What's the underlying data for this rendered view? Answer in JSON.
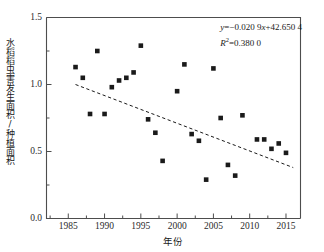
{
  "chart_data": {
    "type": "scatter",
    "title": "",
    "xlabel": "年份",
    "ylabel": "水稻稻虫害发生面积/种植面积",
    "xlim": [
      1982,
      2017
    ],
    "ylim": [
      0.0,
      1.5
    ],
    "grid": false,
    "legend_position": "none",
    "xticks": [
      "1985",
      "1990",
      "1995",
      "2000",
      "2005",
      "2010",
      "2015"
    ],
    "xtick_values": [
      1985,
      1990,
      1995,
      2000,
      2005,
      2010,
      2015
    ],
    "yticks": [
      "0.0",
      "0.5",
      "1.0",
      "1.5"
    ],
    "ytick_values": [
      0.0,
      0.5,
      1.0,
      1.5
    ],
    "minor_ticks": true,
    "marker": "filled-square",
    "marker_color": "#1a1a1a",
    "marker_size": 4.6,
    "x": [
      1986,
      1987,
      1988,
      1989,
      1990,
      1991,
      1992,
      1993,
      1994,
      1995,
      1996,
      1997,
      1998,
      2000,
      2001,
      2002,
      2003,
      2004,
      2005,
      2006,
      2007,
      2008,
      2009,
      2011,
      2012,
      2013,
      2014,
      2015
    ],
    "y": [
      1.13,
      1.05,
      0.78,
      1.25,
      0.78,
      0.98,
      1.03,
      1.05,
      1.09,
      1.29,
      0.74,
      0.64,
      0.43,
      0.95,
      1.15,
      0.63,
      0.58,
      0.29,
      1.12,
      0.75,
      0.4,
      0.32,
      0.77,
      0.59,
      0.59,
      0.52,
      0.56,
      0.49
    ],
    "series": [
      {
        "name": "水稻稻虫害发生面积/种植面积",
        "x": [
          1986,
          1987,
          1988,
          1989,
          1990,
          1991,
          1992,
          1993,
          1994,
          1995,
          1996,
          1997,
          1998,
          2000,
          2001,
          2002,
          2003,
          2004,
          2005,
          2006,
          2007,
          2008,
          2009,
          2011,
          2012,
          2013,
          2014,
          2015
        ],
        "values": [
          1.13,
          1.05,
          0.78,
          1.25,
          0.78,
          0.98,
          1.03,
          1.05,
          1.09,
          1.29,
          0.74,
          0.64,
          0.43,
          0.95,
          1.15,
          0.63,
          0.58,
          0.29,
          1.12,
          0.75,
          0.4,
          0.32,
          0.77,
          0.59,
          0.59,
          0.52,
          0.56,
          0.49
        ]
      }
    ],
    "trendline": {
      "style": "dashed",
      "color": "#1a1a1a",
      "slope": -0.0209,
      "intercept": 42.6504,
      "x_start": 1986.0,
      "x_end": 2016.0,
      "y_start": 1.0,
      "y_end": 0.38
    },
    "annotations": {
      "equation_y": "y",
      "equation_rest": "=−0.020 9",
      "equation_x": "x",
      "equation_tail": "+42.650 4",
      "equation_full": "y=−0.020 9x+42.650 4",
      "r_squared_symbol": "R",
      "r_squared_exp": "2",
      "r_squared_value": "=0.380 0",
      "r_squared_full": "R2=0.380 0"
    }
  },
  "axes": {
    "x_tick_labels": [
      "1985",
      "1990",
      "1995",
      "2000",
      "2005",
      "2010",
      "2015"
    ],
    "y_tick_labels": [
      "0.0",
      "0.5",
      "1.0",
      "1.5"
    ],
    "x_axis_title": "年份",
    "y_axis_title": "水稻稻虫害发生面积/种植面积"
  },
  "colors": {
    "marker": "#1a1a1a",
    "axis": "#4d4d4d",
    "trendline": "#1a1a1a",
    "background": "#ffffff",
    "text": "#1a1a1a"
  }
}
